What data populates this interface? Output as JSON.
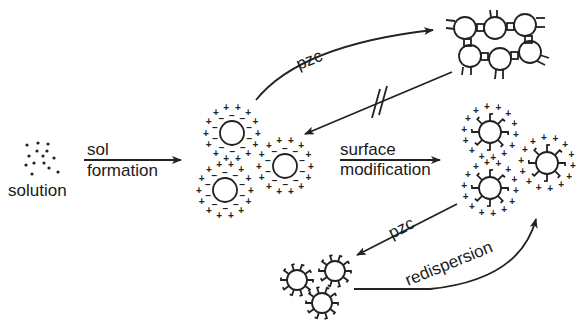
{
  "diagram": {
    "colors": {
      "ink": "#222222",
      "background": "#ffffff"
    },
    "nodes": [
      {
        "id": "solution",
        "label": "solution",
        "depiction": "scattered dots"
      },
      {
        "id": "charged-sol",
        "label": "",
        "depiction": "three particles with electric double layer (+/- charges)"
      },
      {
        "id": "gel-network",
        "label": "",
        "depiction": "aggregated particles linked by bridges"
      },
      {
        "id": "modified-sol",
        "label": "",
        "depiction": "three surface-modified particles with charges"
      },
      {
        "id": "modified-aggregate",
        "label": "",
        "depiction": "three particles with grafted surface groups"
      }
    ],
    "edges": [
      {
        "from": "solution",
        "to": "charged-sol",
        "label_line1": "sol",
        "label_line2": "formation"
      },
      {
        "from": "charged-sol",
        "to": "gel-network",
        "label": "pzc"
      },
      {
        "from": "gel-network",
        "to": "charged-sol",
        "label": "",
        "note": "irreversible (crossed //)"
      },
      {
        "from": "charged-sol",
        "to": "modified-sol",
        "label_line1": "surface",
        "label_line2": "modification"
      },
      {
        "from": "modified-sol",
        "to": "modified-aggregate",
        "label": "pzc"
      },
      {
        "from": "modified-aggregate",
        "to": "modified-sol",
        "label": "redispersion"
      }
    ]
  },
  "labels": {
    "solution": "solution",
    "sol": "sol",
    "formation": "formation",
    "pzc_top": "pzc",
    "surface": "surface",
    "modification": "modification",
    "pzc_bottom": "pzc",
    "redispersion": "redispersion"
  }
}
